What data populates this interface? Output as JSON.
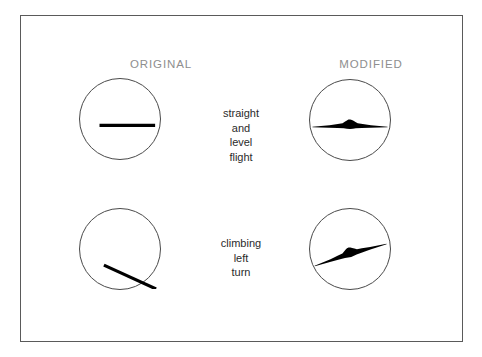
{
  "figure": {
    "background_color": "#ffffff",
    "frame_color": "#5a5a5a",
    "ink_color": "#000000"
  },
  "headings": {
    "left": "ORIGINAL",
    "right": "MODIFIED",
    "color": "#8e8e8e"
  },
  "rows": [
    {
      "id": "straight-and-level-flight",
      "caption_lines": [
        "straight",
        "and",
        "level",
        "flight"
      ],
      "original": {
        "symbol": "horizontal-line",
        "description": "thick horizontal black line centered in circle"
      },
      "modified": {
        "symbol": "flying-wing-aircraft-level",
        "description": "flying wing aircraft silhouette, wings level",
        "bank_angle_deg": 0
      }
    },
    {
      "id": "climbing-left-turn",
      "caption_lines": [
        "climbing",
        "left",
        "turn"
      ],
      "original": {
        "symbol": "diagonal-line",
        "description": "thick diagonal black line descending left to right",
        "bank_angle_deg": 24
      },
      "modified": {
        "symbol": "flying-wing-aircraft-banked",
        "description": "flying wing aircraft silhouette, banked left and climbing",
        "bank_angle_deg": -17
      }
    }
  ],
  "scopes": {
    "diameter_px": 82,
    "border_color": "#4a4a4a"
  }
}
